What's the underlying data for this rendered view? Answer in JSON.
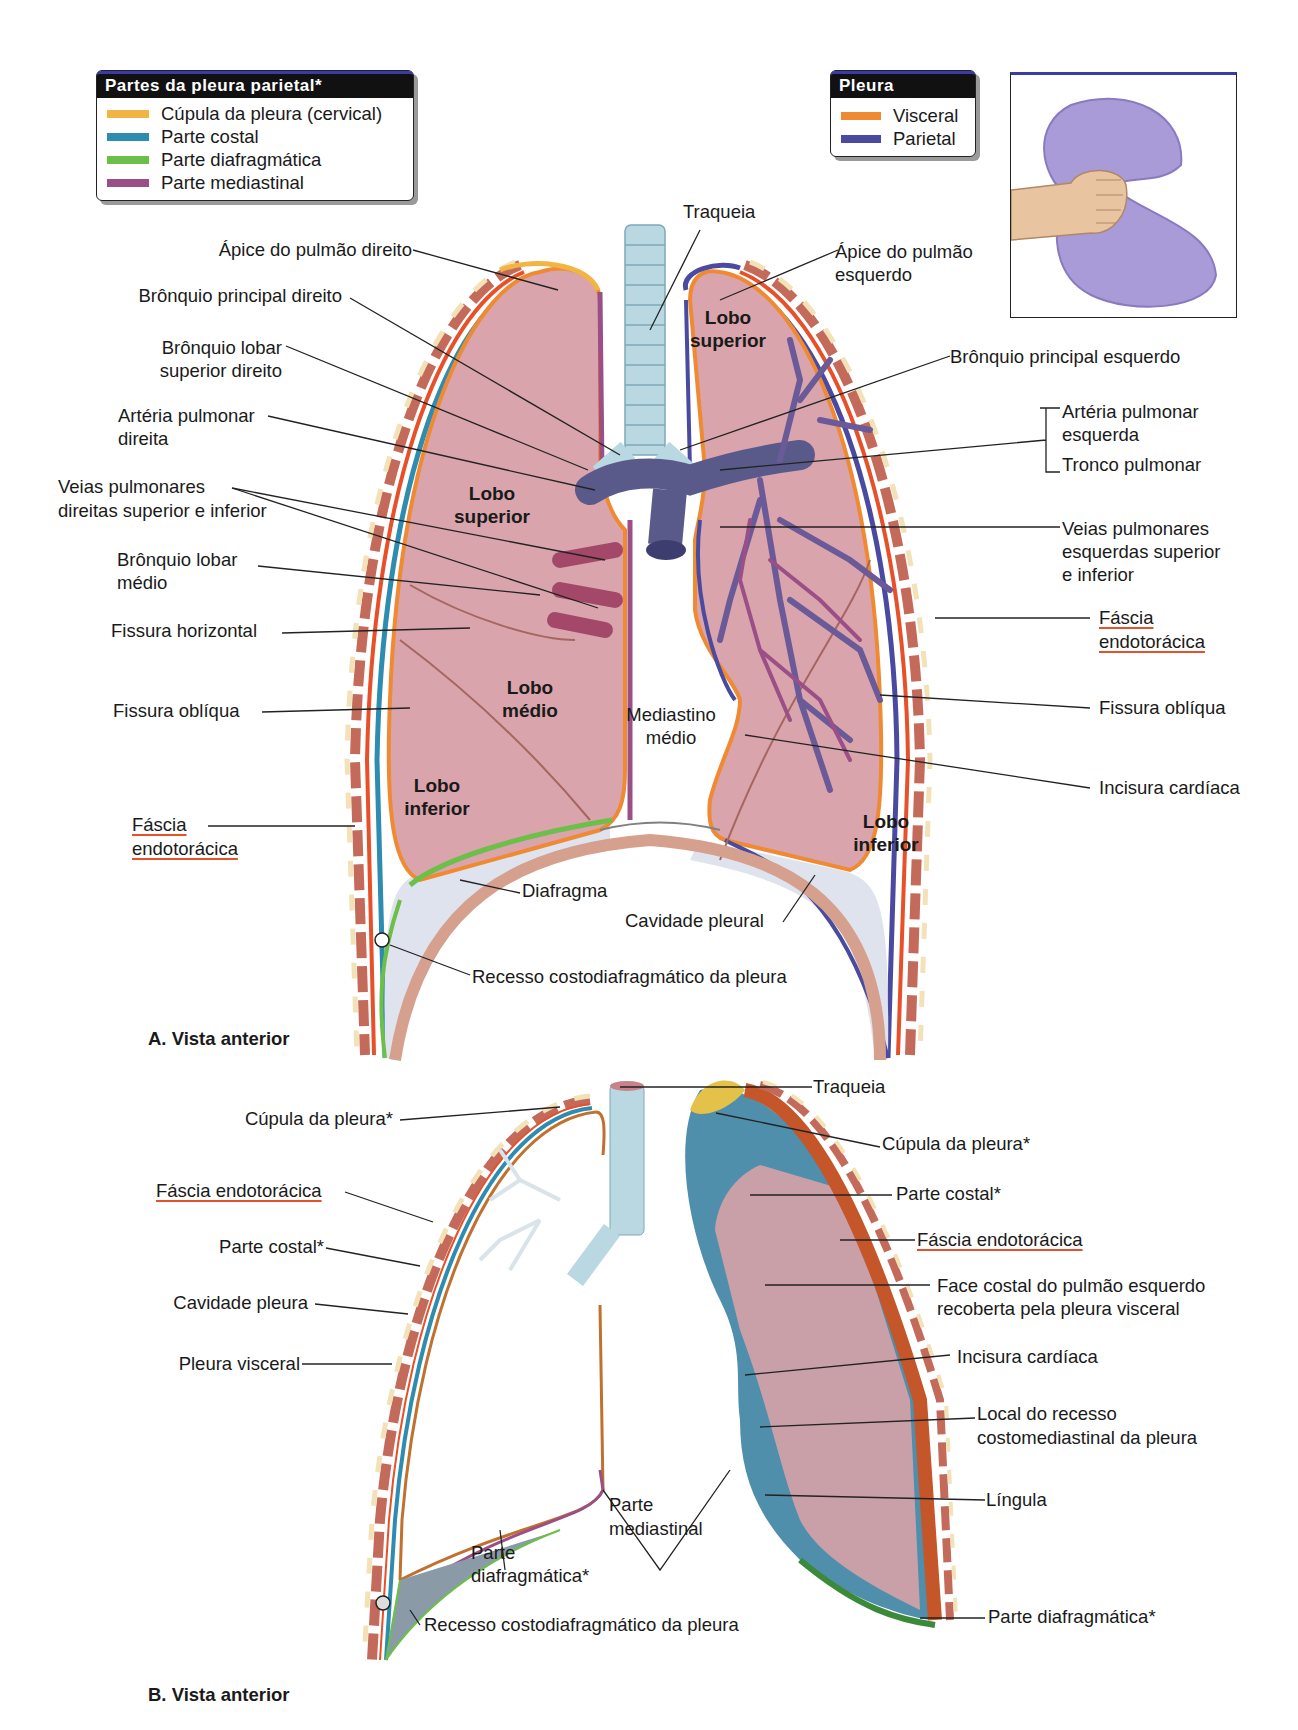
{
  "colors": {
    "cupula": "#f2b544",
    "costal": "#2e8cb0",
    "diafragmatica": "#6cbf48",
    "mediastinal": "#9b4f87",
    "visceral": "#f08a32",
    "parietal": "#4a4aa0",
    "lung_fill": "#d9a4ac",
    "fascia": "#e8502a",
    "pleural_cavity": "#dfe3ee",
    "trachea": "#b9d8e2"
  },
  "legend_parietal": {
    "title": "Partes da pleura parietal*",
    "items": [
      {
        "label": "Cúpula da pleura (cervical)",
        "color": "#f2b544"
      },
      {
        "label": "Parte costal",
        "color": "#2e8cb0"
      },
      {
        "label": "Parte diafragmática",
        "color": "#6cbf48"
      },
      {
        "label": "Parte mediastinal",
        "color": "#9b4f87"
      }
    ]
  },
  "legend_pleura": {
    "title": "Pleura",
    "items": [
      {
        "label": "Visceral",
        "color": "#f08a32"
      },
      {
        "label": "Parietal",
        "color": "#4a4aa0"
      }
    ]
  },
  "inset": {
    "subject": "fist-in-balloon-analogy"
  },
  "figure_a": {
    "caption": "A. Vista anterior",
    "labels": {
      "traqueia": "Traqueia",
      "apice_direito": "Ápice do pulmão direito",
      "apice_esquerdo_1": "Ápice do pulmão",
      "apice_esquerdo_2": "esquerdo",
      "bronquio_principal_direito": "Brônquio principal direito",
      "bronquio_lobar_sup_1": "Brônquio lobar",
      "bronquio_lobar_sup_2": "superior direito",
      "arteria_pulm_dir_1": "Artéria pulmonar",
      "arteria_pulm_dir_2": "direita",
      "veias_dir_1": "Veias pulmonares",
      "veias_dir_2": "direitas superior e inferior",
      "bronquio_lobar_medio_1": "Brônquio lobar",
      "bronquio_lobar_medio_2": "médio",
      "fissura_horizontal": "Fissura horizontal",
      "fissura_obliqua_dir": "Fissura oblíqua",
      "fascia_dir_1": "Fáscia",
      "fascia_dir_2": "endotorácica",
      "bronquio_principal_esquerdo": "Brônquio principal esquerdo",
      "arteria_pulm_esq_1": "Artéria pulmonar",
      "arteria_pulm_esq_2": "esquerda",
      "tronco_pulmonar": "Tronco pulmonar",
      "veias_esq_1": "Veias pulmonares",
      "veias_esq_2": "esquerdas superior",
      "veias_esq_3": "e inferior",
      "fascia_esq_1": "Fáscia",
      "fascia_esq_2": "endotorácica",
      "fissura_obliqua_esq": "Fissura oblíqua",
      "incisura_cardiaca": "Incisura cardíaca",
      "mediastino_1": "Mediastino",
      "mediastino_2": "médio",
      "diafragma": "Diafragma",
      "cavidade_pleural": "Cavidade pleural",
      "recesso": "Recesso costodiafragmático da pleura"
    },
    "lobes": {
      "right_superior": [
        "Lobo",
        "superior"
      ],
      "right_medio": [
        "Lobo",
        "médio"
      ],
      "right_inferior": [
        "Lobo",
        "inferior"
      ],
      "left_superior": [
        "Lobo",
        "superior"
      ],
      "left_inferior": [
        "Lobo",
        "inferior"
      ]
    }
  },
  "figure_b": {
    "caption": "B. Vista anterior",
    "labels": {
      "traqueia": "Traqueia",
      "cupula_left": "Cúpula da pleura*",
      "fascia_left": "Fáscia endotorácica",
      "parte_costal_left": "Parte costal*",
      "cavidade_pleura": "Cavidade pleura",
      "pleura_visceral": "Pleura visceral",
      "parte_diafragmatica_left_1": "Parte",
      "parte_diafragmatica_left_2": "diafragmática*",
      "parte_mediastinal_1": "Parte",
      "parte_mediastinal_2": "mediastinal",
      "recesso": "Recesso costodiafragmático da pleura",
      "cupula_right": "Cúpula da pleura*",
      "parte_costal_right": "Parte costal*",
      "fascia_right": "Fáscia endotorácica",
      "face_costal_1": "Face costal do pulmão esquerdo",
      "face_costal_2": "recoberta pela pleura visceral",
      "incisura_cardiaca": "Incisura cardíaca",
      "local_recesso_1": "Local do recesso",
      "local_recesso_2": "costomediastinal da pleura",
      "lingula": "Língula",
      "parte_diafragmatica_right": "Parte diafragmática*"
    }
  }
}
